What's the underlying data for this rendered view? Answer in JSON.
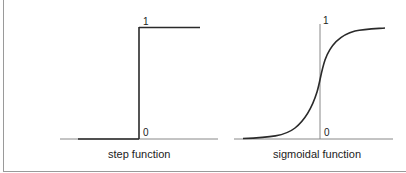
{
  "figure": {
    "panels": [
      {
        "id": "step",
        "caption": "step function",
        "label_top": "1",
        "label_bottom": "0"
      },
      {
        "id": "sigmoid",
        "caption": "sigmoidal function",
        "label_top": "1",
        "label_bottom": "0"
      }
    ],
    "colors": {
      "line": "#2a2a2a",
      "axis": "#777777",
      "border": "#9a9a9a"
    }
  }
}
